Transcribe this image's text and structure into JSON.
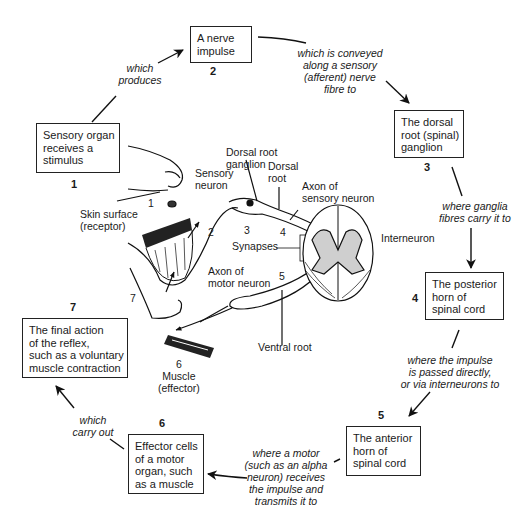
{
  "steps": [
    {
      "number": "1",
      "lines": [
        "Sensory organ",
        "receives a",
        "stimulus"
      ]
    },
    {
      "number": "2",
      "lines": [
        "A nerve",
        "impulse"
      ]
    },
    {
      "number": "3",
      "lines": [
        "The dorsal",
        "root (spinal)",
        "ganglion"
      ]
    },
    {
      "number": "4",
      "lines": [
        "The posterior",
        "horn of",
        "spinal cord"
      ]
    },
    {
      "number": "5",
      "lines": [
        "The anterior",
        "horn of",
        "spinal cord"
      ]
    },
    {
      "number": "6",
      "lines": [
        "Effector cells",
        "of a motor",
        "organ, such",
        "as a muscle"
      ]
    },
    {
      "number": "7",
      "lines": [
        "The final action",
        "of the reflex,",
        "such as a voluntary",
        "muscle contraction"
      ]
    }
  ],
  "connectors": [
    {
      "from": "1",
      "to": "2",
      "lines": [
        "which",
        "produces"
      ]
    },
    {
      "from": "2",
      "to": "3",
      "lines": [
        "which is conveyed",
        "along a sensory",
        "(afferent) nerve",
        "fibre to"
      ]
    },
    {
      "from": "3",
      "to": "4",
      "lines": [
        "where ganglia",
        "fibres carry it to"
      ]
    },
    {
      "from": "4",
      "to": "5",
      "lines": [
        "where the impulse",
        "is passed directly,",
        "or via interneurons to"
      ]
    },
    {
      "from": "5",
      "to": "6",
      "lines": [
        "where a motor",
        "(such as an alpha",
        "neuron) receives",
        "the impulse and",
        "transmits it to"
      ]
    },
    {
      "from": "6",
      "to": "7",
      "lines": [
        "which",
        "carry out"
      ]
    }
  ],
  "illustration": {
    "labels": {
      "dorsal_root_ganglion": [
        "Dorsal root",
        "ganglion"
      ],
      "dorsal_root": [
        "Dorsal",
        "root"
      ],
      "sensory_neuron": [
        "Sensory",
        "neuron"
      ],
      "axon_sensory": [
        "Axon of",
        "sensory neuron"
      ],
      "skin_surface": [
        "Skin surface",
        "(receptor)"
      ],
      "synapses": "Synapses",
      "interneuron": "Interneuron",
      "axon_motor": [
        "Axon of",
        "motor neuron"
      ],
      "ventral_root": "Ventral root",
      "muscle": [
        "Muscle",
        "(effector)"
      ]
    },
    "path_numbers": {
      "n1": "1",
      "n2": "2",
      "n3": "3",
      "n4": "4",
      "n5": "5",
      "n6": "6",
      "n7": "7"
    }
  }
}
